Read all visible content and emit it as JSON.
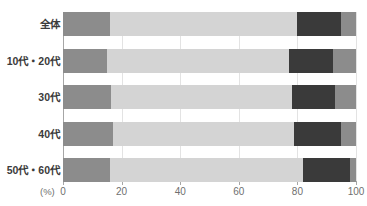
{
  "chart_data": {
    "type": "bar",
    "subtype": "stacked-horizontal-100",
    "title": "",
    "xlabel": "(%)",
    "ylabel": "",
    "xlim": [
      0,
      100
    ],
    "xticks": [
      0,
      20,
      40,
      60,
      80,
      100
    ],
    "xtick_labels": [
      "0",
      "20",
      "40",
      "60",
      "80",
      "100"
    ],
    "grid": true,
    "legend": "none",
    "categories": [
      "全体",
      "10代・20代",
      "30代",
      "40代",
      "50代・60代"
    ],
    "series": [
      {
        "name": "segment-1",
        "color": "#8c8c8c",
        "values": [
          16,
          15,
          16.5,
          17,
          16
        ]
      },
      {
        "name": "segment-2",
        "color": "#d4d4d4",
        "values": [
          64,
          62,
          61.5,
          62,
          66
        ]
      },
      {
        "name": "segment-3",
        "color": "#3a3a3a",
        "values": [
          15,
          15,
          15,
          16,
          16
        ]
      },
      {
        "name": "segment-4",
        "color": "#8c8c8c",
        "values": [
          5,
          8,
          7,
          5,
          2
        ]
      }
    ],
    "segment_boundaries": {
      "全体": [
        16,
        80,
        95,
        100
      ],
      "10代・20代": [
        15,
        77,
        92,
        100
      ],
      "30代": [
        16.5,
        78,
        93,
        100
      ],
      "40代": [
        17,
        79,
        95,
        100
      ],
      "50代・60代": [
        16,
        82,
        98,
        100
      ]
    },
    "colors": {
      "segment_1": "#8c8c8c",
      "segment_2": "#d4d4d4",
      "segment_3": "#3a3a3a",
      "segment_4": "#8c8c8c",
      "axis": "#a6a6a6",
      "grid": "#e3e3e3",
      "label_text": "#3b3b3b",
      "tick_text": "#6f6f6f",
      "background": "#ffffff"
    }
  },
  "axis": {
    "unit_label": "(%)"
  }
}
